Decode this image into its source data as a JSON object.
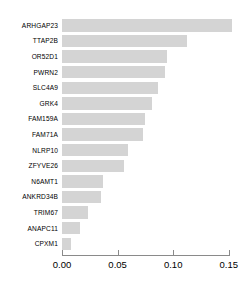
{
  "chart_data": {
    "type": "bar",
    "orientation": "horizontal",
    "title": "",
    "xlabel": "",
    "ylabel": "",
    "xlim": [
      0.0,
      0.15
    ],
    "grid": false,
    "legend": null,
    "bar_color": "#d4d4d4",
    "axis_color": "#8a8a8a",
    "xticks": [
      "0.00",
      "0.05",
      "0.10",
      "0.15"
    ],
    "xtick_values": [
      0.0,
      0.05,
      0.1,
      0.15
    ],
    "categories": [
      "ARHGAP23",
      "TTAP2B",
      "OR52D1",
      "PWRN2",
      "SLC4A9",
      "GRK4",
      "FAM159A",
      "FAM71A",
      "NLRP10",
      "ZFYVE26",
      "N6AMT1",
      "ANKRD34B",
      "TRIM67",
      "ANAPC11",
      "CPXM1"
    ],
    "values": [
      0.153,
      0.112,
      0.094,
      0.093,
      0.086,
      0.081,
      0.075,
      0.073,
      0.059,
      0.056,
      0.037,
      0.035,
      0.023,
      0.016,
      0.008
    ]
  }
}
